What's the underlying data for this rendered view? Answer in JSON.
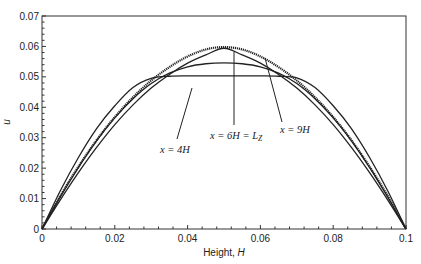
{
  "chart_data": {
    "type": "line",
    "title": "",
    "xlabel": "Height, H",
    "ylabel": "u",
    "xlim": [
      0,
      0.1
    ],
    "ylim": [
      0,
      0.07
    ],
    "grid": false,
    "legend": null,
    "x_ticks": [
      "0",
      "0.02",
      "0.04",
      "0.06",
      "0.08",
      "0.1"
    ],
    "y_ticks": [
      "0",
      "0.01",
      "0.02",
      "0.03",
      "0.04",
      "0.05",
      "0.06",
      "0.07"
    ],
    "x": [
      0,
      0.005,
      0.01,
      0.015,
      0.02,
      0.025,
      0.03,
      0.035,
      0.04,
      0.045,
      0.05,
      0.055,
      0.06,
      0.065,
      0.07,
      0.075,
      0.08,
      0.085,
      0.09,
      0.095,
      0.1
    ],
    "series": [
      {
        "name": "inlet (flat profile)",
        "style": "solid",
        "values": [
          0,
          0.0125,
          0.0235,
          0.033,
          0.0405,
          0.0465,
          0.0495,
          0.0502,
          0.0503,
          0.0503,
          0.0503,
          0.0503,
          0.0503,
          0.0502,
          0.0497,
          0.0465,
          0.0405,
          0.033,
          0.0235,
          0.0125,
          0
        ]
      },
      {
        "name": "x = 4H",
        "style": "solid",
        "values": [
          0,
          0.0105,
          0.0202,
          0.029,
          0.0365,
          0.0428,
          0.0478,
          0.0512,
          0.0533,
          0.0543,
          0.0546,
          0.0543,
          0.0533,
          0.0512,
          0.0478,
          0.0428,
          0.0365,
          0.029,
          0.0202,
          0.0105,
          0
        ]
      },
      {
        "name": "x = 9H",
        "style": "solid",
        "values": [
          0,
          0.0095,
          0.0185,
          0.0268,
          0.0343,
          0.0408,
          0.0463,
          0.0508,
          0.0545,
          0.0572,
          0.0594,
          0.0572,
          0.0545,
          0.0508,
          0.0463,
          0.0408,
          0.0343,
          0.0268,
          0.0185,
          0.0095,
          0
        ]
      },
      {
        "name": "x = 6H = Lz",
        "style": "dotted",
        "values": [
          0,
          0.0108,
          0.0205,
          0.0292,
          0.0368,
          0.0433,
          0.0488,
          0.0532,
          0.0567,
          0.059,
          0.0598,
          0.059,
          0.0567,
          0.0532,
          0.0488,
          0.0433,
          0.0368,
          0.0292,
          0.0205,
          0.0108,
          0
        ]
      }
    ],
    "annotations": [
      {
        "text": "x = 4H",
        "label_at": [
          0.032,
          0.046
        ],
        "points_to": [
          0.041,
          0.0545
        ]
      },
      {
        "text": "x = 6H = L",
        "subscript": "Z",
        "label_at": [
          0.045,
          0.048
        ],
        "points_to": [
          0.052,
          0.059
        ]
      },
      {
        "text": "x = 9H",
        "label_at": [
          0.064,
          0.049
        ],
        "points_to": [
          0.062,
          0.0585
        ]
      }
    ]
  }
}
